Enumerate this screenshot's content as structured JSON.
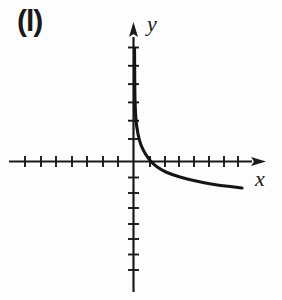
{
  "figure": {
    "label": "(l)",
    "background": "#fdfdfd",
    "ink_color": "#1a1a1a"
  },
  "chart_data": {
    "type": "line",
    "title": "",
    "xlabel": "x",
    "ylabel": "y",
    "grid": false,
    "axes": {
      "x_range": [
        -8,
        9
      ],
      "y_range": [
        -8.5,
        8.5
      ],
      "tick_interval": 1,
      "x_ticks_negative": 7,
      "x_ticks_positive": 7,
      "y_ticks_positive": 6,
      "y_ticks_negative": 7,
      "arrows": [
        "x-positive",
        "y-positive"
      ],
      "axis_numbers_shown": false
    },
    "x_intercept": [
      1,
      0
    ],
    "series": [
      {
        "name": "curve",
        "points_units": [
          [
            0.07,
            6.2
          ],
          [
            0.1,
            3.4
          ],
          [
            0.17,
            2.3
          ],
          [
            0.3,
            1.5
          ],
          [
            0.5,
            0.9
          ],
          [
            0.8,
            0.4
          ],
          [
            1.0,
            0.0
          ],
          [
            1.6,
            -0.4
          ],
          [
            2.3,
            -0.72
          ],
          [
            3.2,
            -1.0
          ],
          [
            4.3,
            -1.3
          ],
          [
            5.5,
            -1.55
          ],
          [
            6.6,
            -1.7
          ],
          [
            7.3,
            -1.78
          ]
        ]
      }
    ],
    "layout": {
      "width": 282,
      "height": 300,
      "origin_px": {
        "x": 133.5,
        "y": 161.5
      },
      "x_axis_px": {
        "start": 9,
        "line_end": 252,
        "tip": 266
      },
      "y_axis_px": {
        "start": 292,
        "line_end": 37,
        "tip": 22
      },
      "x_ticks_px": [
        25,
        41,
        56,
        72,
        87,
        103,
        118,
        150,
        165,
        179,
        194,
        209,
        224,
        238
      ],
      "y_ticks_px": [
        47.5,
        65.8,
        84.1,
        102.4,
        120.7,
        139,
        177.5,
        193,
        208,
        224,
        239,
        254.5,
        270
      ],
      "tick_half_px": 5.5,
      "axis_stroke_px": 2.2,
      "tick_stroke_px": 1.9,
      "curve_stroke_px": 3.1,
      "curve_px": [
        [
          134.5,
          48
        ],
        [
          134.7,
          75
        ],
        [
          135,
          100
        ],
        [
          136,
          120
        ],
        [
          138,
          134
        ],
        [
          141,
          145
        ],
        [
          145.5,
          154
        ],
        [
          151,
          161.5
        ],
        [
          158,
          167.5
        ],
        [
          167,
          172.5
        ],
        [
          180,
          177
        ],
        [
          196,
          181
        ],
        [
          214,
          184.5
        ],
        [
          230,
          186.5
        ],
        [
          242,
          188
        ]
      ],
      "ylabel_px": {
        "x": 147,
        "y": 31
      },
      "xlabel_px": {
        "x": 255,
        "y": 186
      }
    }
  }
}
